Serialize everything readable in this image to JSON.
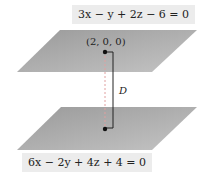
{
  "top_plane": {
    "equation": "3x − y + 2z − 6 = 0",
    "point": "(2, 0, 0)"
  },
  "bottom_plane": {
    "equation": "6x − 2y + 4z + 4 = 0"
  },
  "distance_label": "D",
  "colors": {
    "plane": "#a8a8a8",
    "label_bg": "#ececec"
  }
}
